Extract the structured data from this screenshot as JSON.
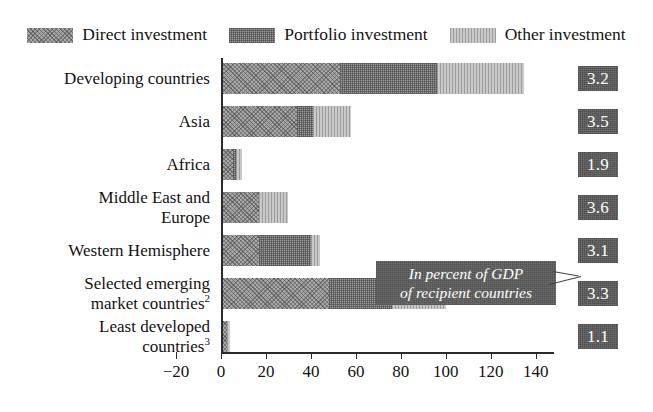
{
  "chart_data": {
    "type": "bar",
    "orientation": "horizontal",
    "stacked": true,
    "title": "",
    "xlabel": "",
    "ylabel": "",
    "xlim": [
      -20,
      140
    ],
    "xticks": [
      -20,
      0,
      20,
      40,
      60,
      80,
      100,
      120,
      140
    ],
    "grid": false,
    "legend_position": "top",
    "annotation": "In percent of GDP of recipient countries",
    "categories": [
      "Developing countries",
      "Asia",
      "Africa",
      "Middle East and Europe",
      "Western Hemisphere",
      "Selected emerging market countries",
      "Least developed countries"
    ],
    "series": [
      {
        "name": "Direct investment",
        "values": [
          52.0,
          33.0,
          4.5,
          16.0,
          16.0,
          47.0,
          2.0
        ]
      },
      {
        "name": "Portfolio investment",
        "values": [
          43.0,
          7.0,
          1.5,
          0.0,
          23.0,
          28.0,
          0.0
        ]
      },
      {
        "name": "Other investment",
        "values": [
          39.0,
          17.0,
          2.5,
          13.0,
          4.0,
          24.0,
          1.0
        ]
      }
    ],
    "totals": [
      134.0,
      57.0,
      8.5,
      29.0,
      43.0,
      99.0,
      3.0
    ],
    "value_labels": [
      "3.2",
      "3.5",
      "1.9",
      "3.6",
      "3.1",
      "3.3",
      "1.1"
    ],
    "value_labels_unit": "percent of GDP"
  },
  "legend": {
    "items": [
      {
        "label": "Direct investment",
        "swatch": "hatch-diagonal-medium-gray",
        "color": "#a8a8a8"
      },
      {
        "label": "Portfolio investment",
        "swatch": "hatch-crosshatch-dark-gray",
        "color": "#9a9a9a"
      },
      {
        "label": "Other investment",
        "swatch": "hatch-vertical-light-gray",
        "color": "#c9c9c9"
      }
    ]
  },
  "rows": [
    {
      "label_line1": "Developing countries",
      "label_line2": "",
      "footnote": "",
      "badge": "3.2"
    },
    {
      "label_line1": "Asia",
      "label_line2": "",
      "footnote": "",
      "badge": "3.5"
    },
    {
      "label_line1": "Africa",
      "label_line2": "",
      "footnote": "",
      "badge": "1.9"
    },
    {
      "label_line1": "Middle East and",
      "label_line2": "Europe",
      "footnote": "",
      "badge": "3.6"
    },
    {
      "label_line1": "Western Hemisphere",
      "label_line2": "",
      "footnote": "",
      "badge": "3.1"
    },
    {
      "label_line1": "Selected emerging",
      "label_line2": "market countries",
      "footnote": "2",
      "badge": "3.3"
    },
    {
      "label_line1": "Least developed",
      "label_line2": "countries",
      "footnote": "3",
      "badge": "1.1"
    }
  ],
  "callout": {
    "line1": "In percent of GDP",
    "line2": "of recipient countries"
  },
  "xaxis": {
    "ticks": [
      "−20",
      "0",
      "20",
      "40",
      "60",
      "80",
      "100",
      "120",
      "140"
    ]
  },
  "colors": {
    "direct": "#a8a8a8",
    "portfolio": "#9a9a9a",
    "other": "#c9c9c9",
    "badge_bg": "#6e6e6e",
    "axis": "#2a2a2a",
    "text": "#121212"
  }
}
